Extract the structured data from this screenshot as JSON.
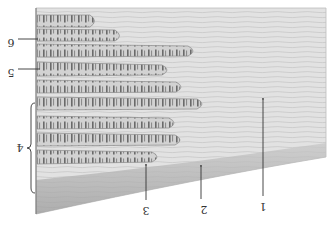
{
  "figure": {
    "orientation": "rotated 180 degrees",
    "colors": {
      "background": "#ffffff",
      "tendon": "#dcdcdc",
      "tendon_streak": "#b8b8b8",
      "fiber_fill": "#cfcfcf",
      "fiber_band": "#6a6a6a",
      "fiber_outline": "#8a8a8a",
      "sheath": "#9a9a9a",
      "leader": "#333333"
    },
    "labels": [
      {
        "id": "1",
        "text": "1",
        "x": 263,
        "y": 203,
        "line": [
          263,
          100,
          263,
          196
        ]
      },
      {
        "id": "2",
        "text": "2",
        "x": 204,
        "y": 206,
        "line": [
          201,
          167,
          201,
          199
        ]
      },
      {
        "id": "3",
        "text": "3",
        "x": 146,
        "y": 207,
        "line": [
          146,
          166,
          146,
          200
        ]
      },
      {
        "id": "4",
        "text": "4",
        "x": 20,
        "y": 155,
        "brace": [
          33,
          103,
          33,
          193
        ]
      },
      {
        "id": "5",
        "text": "5",
        "x": 11,
        "y": 72,
        "line": [
          18,
          69,
          40,
          69
        ]
      },
      {
        "id": "6",
        "text": "6",
        "x": 11,
        "y": 43,
        "line": [
          18,
          39,
          38,
          39
        ]
      }
    ],
    "fibers": [
      {
        "y": 15,
        "h": 12,
        "end": 97
      },
      {
        "y": 29,
        "h": 12,
        "end": 122
      },
      {
        "y": 44,
        "h": 12,
        "end": 196
      },
      {
        "y": 63,
        "h": 12,
        "end": 170
      },
      {
        "y": 80,
        "h": 12,
        "end": 184
      },
      {
        "y": 97,
        "h": 12,
        "end": 205
      },
      {
        "y": 116,
        "h": 12,
        "end": 177
      },
      {
        "y": 133,
        "h": 12,
        "end": 183
      },
      {
        "y": 150,
        "h": 12,
        "end": 161
      }
    ]
  }
}
